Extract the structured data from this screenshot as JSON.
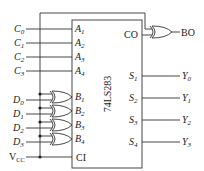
{
  "chip": {
    "name": "74LS283",
    "carry_in": "CI",
    "carry_out": "CO"
  },
  "inputs_c": [
    {
      "label": "C",
      "sub": "0",
      "pin": "A",
      "pin_sub": "1"
    },
    {
      "label": "C",
      "sub": "1",
      "pin": "A",
      "pin_sub": "2"
    },
    {
      "label": "C",
      "sub": "2",
      "pin": "A",
      "pin_sub": "3"
    },
    {
      "label": "C",
      "sub": "3",
      "pin": "A",
      "pin_sub": "4"
    }
  ],
  "inputs_d": [
    {
      "label": "D",
      "sub": "0",
      "pin": "B",
      "pin_sub": "1"
    },
    {
      "label": "D",
      "sub": "1",
      "pin": "B",
      "pin_sub": "2"
    },
    {
      "label": "D",
      "sub": "2",
      "pin": "B",
      "pin_sub": "3"
    },
    {
      "label": "D",
      "sub": "3",
      "pin": "B",
      "pin_sub": "4"
    }
  ],
  "vcc": {
    "label": "V",
    "sub": "CC"
  },
  "outputs": [
    {
      "pin": "S",
      "pin_sub": "1",
      "label": "Y",
      "sub": "0"
    },
    {
      "pin": "S",
      "pin_sub": "2",
      "label": "Y",
      "sub": "1"
    },
    {
      "pin": "S",
      "pin_sub": "3",
      "label": "Y",
      "sub": "2"
    },
    {
      "pin": "S",
      "pin_sub": "4",
      "label": "Y",
      "sub": "3"
    }
  ],
  "borrow_out": "BO"
}
